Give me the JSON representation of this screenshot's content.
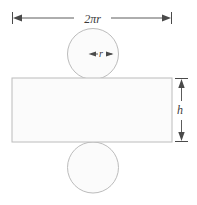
{
  "figure": {
    "background_color": "#ffffff",
    "shape_fill_color": "#fbfbfb",
    "shape_stroke_color": "#bcbcbc",
    "dimension_color": "#4a4a4a",
    "label_color": "#3a3a3a"
  },
  "labels": {
    "width_label": "2πr",
    "radius_label": "r",
    "height_label": "h"
  },
  "geometry": {
    "rectangle": {
      "x": 12,
      "y": 78,
      "width": 160,
      "height": 64
    },
    "top_circle": {
      "cx": 93,
      "cy": 54,
      "r": 25.5
    },
    "bottom_circle": {
      "cx": 93,
      "cy": 167.5,
      "r": 25.5
    },
    "width_dimension": {
      "y": 18,
      "x_start": 12,
      "x_end": 172
    },
    "radius_dimension": {
      "y": 54,
      "x_start": 89,
      "x_end": 113
    },
    "height_dimension": {
      "x": 181,
      "y_start": 78,
      "y_end": 142
    }
  }
}
